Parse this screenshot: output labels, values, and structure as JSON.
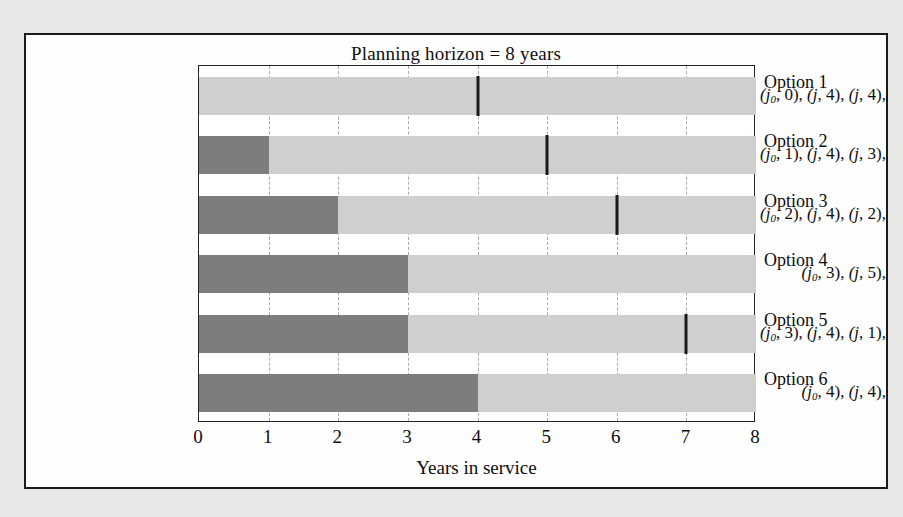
{
  "chart_data": {
    "type": "bar",
    "orientation": "horizontal",
    "title": "Planning horizon = 8 years",
    "xlabel": "Years in service",
    "ylabel": "",
    "xlim": [
      0,
      8
    ],
    "xticks": [
      "0",
      "1",
      "2",
      "3",
      "4",
      "5",
      "6",
      "7",
      "8"
    ],
    "grid": true,
    "legend": "none",
    "colors": {
      "dark_segment": "#7d7d7d",
      "light_segment": "#cfcfcf",
      "marker": "#1a1a1a",
      "gridline": "#a9a9a9",
      "frame": "#1b1b1b",
      "page_background": "#e8e8e6",
      "plot_background": "#ffffff"
    },
    "categories": [
      "Option 1",
      "Option 2",
      "Option 3",
      "Option 4",
      "Option 5",
      "Option 6"
    ],
    "rows": [
      {
        "option": "Option 1",
        "policy": "(j0, 0), (j, 4), (j, 4),",
        "policy_parts": [
          {
            "sub": "0",
            "val": "0"
          },
          {
            "sub": "",
            "val": "4"
          },
          {
            "sub": "",
            "val": "4"
          }
        ],
        "dark_end": 0,
        "light_start": 0,
        "light_end": 8,
        "marker": 4
      },
      {
        "option": "Option 2",
        "policy": "(j0, 1), (j, 4), (j, 3),",
        "policy_parts": [
          {
            "sub": "0",
            "val": "1"
          },
          {
            "sub": "",
            "val": "4"
          },
          {
            "sub": "",
            "val": "3"
          }
        ],
        "dark_end": 1,
        "light_start": 1,
        "light_end": 8,
        "marker": 5
      },
      {
        "option": "Option 3",
        "policy": "(j0, 2), (j, 4), (j, 2),",
        "policy_parts": [
          {
            "sub": "0",
            "val": "2"
          },
          {
            "sub": "",
            "val": "4"
          },
          {
            "sub": "",
            "val": "2"
          }
        ],
        "dark_end": 2,
        "light_start": 2,
        "light_end": 8,
        "marker": 6
      },
      {
        "option": "Option 4",
        "policy": "(j0, 3), (j, 5),",
        "policy_parts": [
          {
            "sub": "0",
            "val": "3"
          },
          {
            "sub": "",
            "val": "5"
          }
        ],
        "dark_end": 3,
        "light_start": 3,
        "light_end": 8,
        "marker": null
      },
      {
        "option": "Option 5",
        "policy": "(j0, 3), (j, 4), (j, 1),",
        "policy_parts": [
          {
            "sub": "0",
            "val": "3"
          },
          {
            "sub": "",
            "val": "4"
          },
          {
            "sub": "",
            "val": "1"
          }
        ],
        "dark_end": 3,
        "light_start": 3,
        "light_end": 8,
        "marker": 7
      },
      {
        "option": "Option 6",
        "policy": "(j0, 4), (j, 4),",
        "policy_parts": [
          {
            "sub": "0",
            "val": "4"
          },
          {
            "sub": "",
            "val": "4"
          }
        ],
        "dark_end": 4,
        "light_start": 4,
        "light_end": 8,
        "marker": null
      }
    ]
  }
}
